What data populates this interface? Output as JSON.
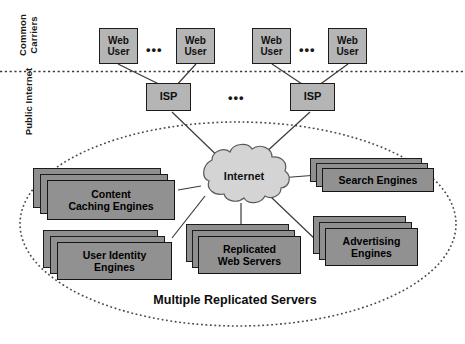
{
  "figure": {
    "caption": "Multiple Replicated Servers",
    "cloud_label": "Internet",
    "ellipsis": "•••"
  },
  "zones": [
    {
      "id": "common-carriers",
      "label": "Common\nCarriers"
    },
    {
      "id": "public-internet",
      "label": "Public Internet"
    }
  ],
  "users": [
    {
      "label": "Web\nUser"
    },
    {
      "label": "Web\nUser"
    },
    {
      "label": "Web\nUser"
    },
    {
      "label": "Web\nUser"
    }
  ],
  "isps": [
    {
      "label": "ISP"
    },
    {
      "label": "ISP"
    }
  ],
  "servers": [
    {
      "id": "content-caching-engines",
      "label": "Content\nCaching Engines"
    },
    {
      "id": "search-engines",
      "label": "Search Engines"
    },
    {
      "id": "user-identity-engines",
      "label": "User Identity\nEngines"
    },
    {
      "id": "replicated-web-servers",
      "label": "Replicated\nWeb Servers"
    },
    {
      "id": "advertising-engines",
      "label": "Advertising\nEngines"
    }
  ],
  "colors": {
    "user_box_fill": "#b5b5b5",
    "isp_box_fill": "#b5b5b5",
    "server_box_fill": "#919191",
    "cloud_fill": "#d4d4d4",
    "stroke": "#1c1c1c",
    "background": "#ffffff"
  }
}
